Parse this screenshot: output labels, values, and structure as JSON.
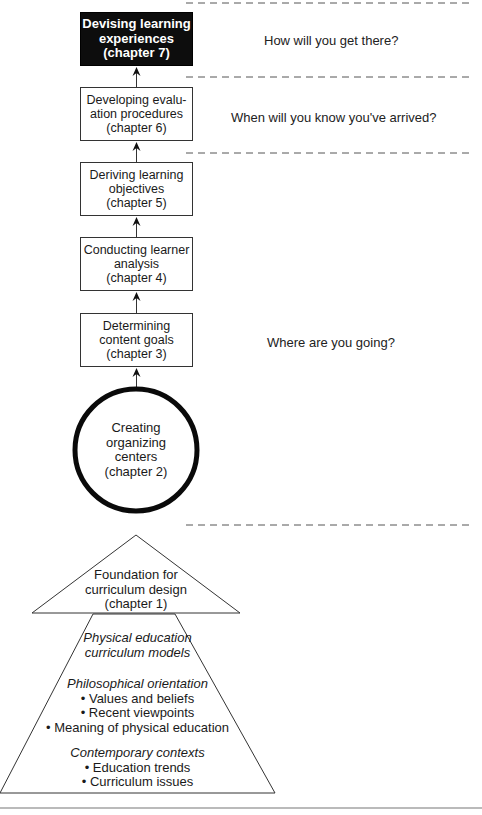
{
  "diagram": {
    "steps": [
      {
        "id": "step-7",
        "lines": [
          "Devising learning",
          "experiences",
          "(chapter 7)"
        ],
        "style": "dark"
      },
      {
        "id": "step-6",
        "lines": [
          "Developing evalu-",
          "ation procedures",
          "(chapter 6)"
        ],
        "style": "light"
      },
      {
        "id": "step-5",
        "lines": [
          "Deriving learning",
          "objectives",
          "(chapter 5)"
        ],
        "style": "light"
      },
      {
        "id": "step-4",
        "lines": [
          "Conducting learner",
          "analysis",
          "(chapter 4)"
        ],
        "style": "light"
      },
      {
        "id": "step-3",
        "lines": [
          "Determining",
          "content goals",
          "(chapter 3)"
        ],
        "style": "light"
      }
    ],
    "circle": {
      "lines": [
        "Creating",
        "organizing",
        "centers",
        "(chapter 2)"
      ]
    },
    "foundation": {
      "lines": [
        "Foundation for",
        "curriculum design",
        "(chapter 1)"
      ]
    },
    "base": {
      "groups": [
        {
          "heading": [
            "Physical education",
            "curriculum models"
          ],
          "bullets": []
        },
        {
          "heading": [
            "Philosophical orientation"
          ],
          "bullets": [
            "• Values and beliefs",
            "• Recent viewpoints",
            "• Meaning of physical education"
          ]
        },
        {
          "heading": [
            "Contemporary contexts"
          ],
          "bullets": [
            "• Education trends",
            "• Curriculum issues"
          ]
        }
      ]
    },
    "questions": {
      "q1": "How will you get there?",
      "q2": "When will you know you've arrived?",
      "q3": "Where are you going?"
    },
    "colors": {
      "dark_box": "#0d0d0d",
      "line": "#333333",
      "circle_stroke": "#0a0a0a"
    }
  }
}
